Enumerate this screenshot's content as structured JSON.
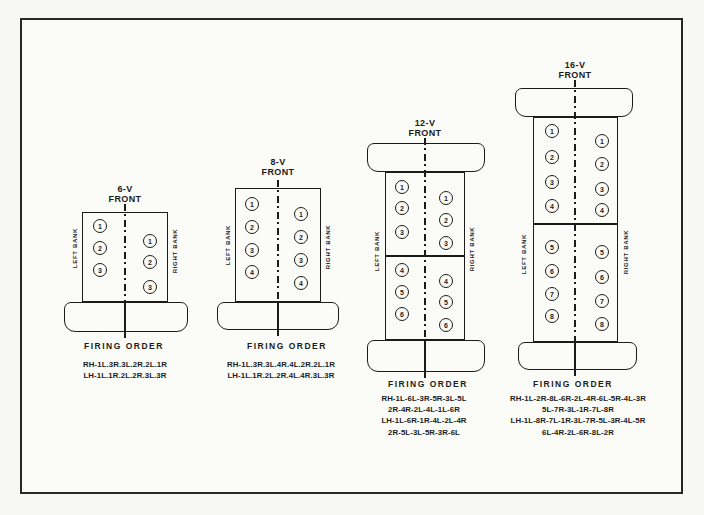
{
  "page": {
    "background": "#fbfbf8",
    "ink_color": "#1b1b1b"
  },
  "diagrams": [
    {
      "id": "6v",
      "title": "6-V",
      "subtitle": "FRONT",
      "left_bank_label": "LEFT BANK",
      "right_bank_label": "RIGHT BANK",
      "left_cylinders": [
        1,
        2,
        3
      ],
      "right_cylinders": [
        1,
        2,
        3
      ],
      "firing_order_label": "FIRING ORDER",
      "firing_order_lines": [
        "RH-1L.3R.3L.2R.2L.1R",
        "LH-1L.1R.2L.2R.3L.3R"
      ]
    },
    {
      "id": "8v",
      "title": "8-V",
      "subtitle": "FRONT",
      "left_bank_label": "LEFT BANK",
      "right_bank_label": "RIGHT BANK",
      "left_cylinders": [
        1,
        2,
        3,
        4
      ],
      "right_cylinders": [
        1,
        2,
        3,
        4
      ],
      "firing_order_label": "FIRING ORDER",
      "firing_order_lines": [
        "RH-1L.3R.3L.4R.4L.2R.2L.1R",
        "LH-1L.1R.2L.2R.4L.4R.3L.3R"
      ]
    },
    {
      "id": "12v",
      "title": "12-V",
      "subtitle": "FRONT",
      "left_bank_label": "LEFT BANK",
      "right_bank_label": "RIGHT BANK",
      "left_cylinders": [
        1,
        2,
        3,
        4,
        5,
        6
      ],
      "right_cylinders": [
        1,
        2,
        3,
        4,
        5,
        6
      ],
      "firing_order_label": "FIRING ORDER",
      "firing_order_lines": [
        "RH-1L-6L-3R-5R-3L-5L",
        "2R-4R-2L-4L-1L-6R",
        "LH-1L-6R-1R-4L-2L-4R",
        "2R-5L-3L-5R-3R-6L"
      ]
    },
    {
      "id": "16v",
      "title": "16-V",
      "subtitle": "FRONT",
      "left_bank_label": "LEFT BANK",
      "right_bank_label": "RIGHT BANK",
      "left_cylinders": [
        1,
        2,
        3,
        4,
        5,
        6,
        7,
        8
      ],
      "right_cylinders": [
        1,
        2,
        3,
        4,
        5,
        6,
        7,
        8
      ],
      "firing_order_label": "FIRING ORDER",
      "firing_order_lines": [
        "RH-1L-2R-8L-6R-2L-4R-6L-5R-4L-3R",
        "5L-7R-3L-1R-7L-8R",
        "LH-1L-8R-7L-1R-3L-7R-5L-3R-4L-5R",
        "6L-4R-2L-6R-8L-2R"
      ]
    }
  ]
}
